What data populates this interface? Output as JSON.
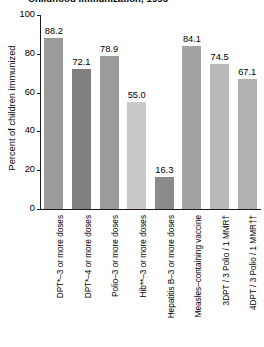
{
  "chart_data": {
    "type": "bar",
    "title": "Childhood immunization, 1996",
    "xlabel": "",
    "ylabel": "Percent of children immunized",
    "ylim": [
      0,
      100
    ],
    "yticks": [
      "0",
      "20",
      "40",
      "60",
      "80",
      "100"
    ],
    "grid": false,
    "legend": "none",
    "categories": [
      "DPT*–3 or more doses",
      "DPT*–4 or more doses",
      "Polio–3 or more doses",
      "Hib**–3 or more doses",
      "Hepatitis B–3 or more doses",
      "Measles–containing vaccine",
      "3DPT / 3 Polio / 1 MMR†",
      "4DPT / 3 Polio / 1 MMR††"
    ],
    "values": [
      88.2,
      72.1,
      78.9,
      55.0,
      16.3,
      84.1,
      74.5,
      67.1
    ],
    "value_labels": [
      "88.2",
      "72.1",
      "78.9",
      "55.0",
      "16.3",
      "84.1",
      "74.5",
      "67.1"
    ],
    "bar_colors": [
      "#9b9b9b",
      "#808080",
      "#9b9b9b",
      "#c9c9c9",
      "#8a8a8a",
      "#a3a3a3",
      "#b9b9b9",
      "#b0b0b0"
    ]
  },
  "axis": {
    "line_color": "#1a1a1a"
  }
}
